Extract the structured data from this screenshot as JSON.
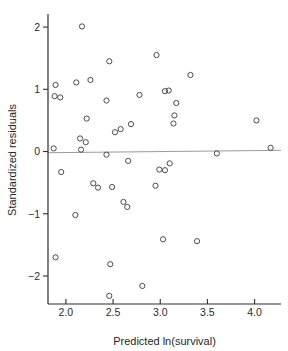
{
  "chart_data": {
    "type": "scatter",
    "title": "",
    "xlabel": "Predicted ln(survival)",
    "ylabel": "Standardized residuals",
    "xlim": [
      1.81,
      4.28
    ],
    "ylim": [
      -2.45,
      2.21
    ],
    "xticks": [
      2.0,
      2.5,
      3.0,
      3.5,
      4.0
    ],
    "xticklabels": [
      "2.0",
      "2.5",
      "3.0",
      "3.5",
      "4.0"
    ],
    "yticks": [
      2,
      1,
      0,
      -1,
      -2
    ],
    "yticklabels": [
      "2",
      "1",
      "0",
      "−1",
      "−2"
    ],
    "grid": false,
    "legend": null,
    "marker": "open-circle",
    "reference_lines": [
      {
        "name": "zero-residual-line",
        "type": "horizontal",
        "y": 0,
        "color": "#9a9aa0"
      }
    ],
    "points": [
      {
        "x": 2.17,
        "y": 2.01
      },
      {
        "x": 2.96,
        "y": 1.55
      },
      {
        "x": 2.46,
        "y": 1.45
      },
      {
        "x": 3.32,
        "y": 1.23
      },
      {
        "x": 2.26,
        "y": 1.15
      },
      {
        "x": 2.11,
        "y": 1.11
      },
      {
        "x": 1.89,
        "y": 1.07
      },
      {
        "x": 3.09,
        "y": 0.98
      },
      {
        "x": 3.05,
        "y": 0.97
      },
      {
        "x": 2.78,
        "y": 0.91
      },
      {
        "x": 1.88,
        "y": 0.89
      },
      {
        "x": 1.94,
        "y": 0.87
      },
      {
        "x": 2.43,
        "y": 0.82
      },
      {
        "x": 3.17,
        "y": 0.78
      },
      {
        "x": 3.15,
        "y": 0.58
      },
      {
        "x": 2.22,
        "y": 0.53
      },
      {
        "x": 4.02,
        "y": 0.5
      },
      {
        "x": 3.14,
        "y": 0.45
      },
      {
        "x": 2.69,
        "y": 0.44
      },
      {
        "x": 2.58,
        "y": 0.36
      },
      {
        "x": 2.52,
        "y": 0.31
      },
      {
        "x": 2.15,
        "y": 0.21
      },
      {
        "x": 2.21,
        "y": 0.15
      },
      {
        "x": 4.17,
        "y": 0.06
      },
      {
        "x": 1.87,
        "y": 0.05
      },
      {
        "x": 2.16,
        "y": 0.03
      },
      {
        "x": 3.6,
        "y": -0.03
      },
      {
        "x": 2.43,
        "y": -0.05
      },
      {
        "x": 2.66,
        "y": -0.15
      },
      {
        "x": 3.1,
        "y": -0.19
      },
      {
        "x": 2.99,
        "y": -0.29
      },
      {
        "x": 3.05,
        "y": -0.3
      },
      {
        "x": 1.95,
        "y": -0.33
      },
      {
        "x": 2.29,
        "y": -0.51
      },
      {
        "x": 2.95,
        "y": -0.55
      },
      {
        "x": 2.49,
        "y": -0.57
      },
      {
        "x": 2.34,
        "y": -0.58
      },
      {
        "x": 2.61,
        "y": -0.81
      },
      {
        "x": 2.65,
        "y": -0.89
      },
      {
        "x": 2.1,
        "y": -1.02
      },
      {
        "x": 3.39,
        "y": -1.44
      },
      {
        "x": 3.03,
        "y": -1.41
      },
      {
        "x": 1.89,
        "y": -1.7
      },
      {
        "x": 2.47,
        "y": -1.81
      },
      {
        "x": 2.81,
        "y": -2.16
      },
      {
        "x": 2.46,
        "y": -2.32
      }
    ]
  },
  "figure": {
    "marker_radius": 2.6
  }
}
